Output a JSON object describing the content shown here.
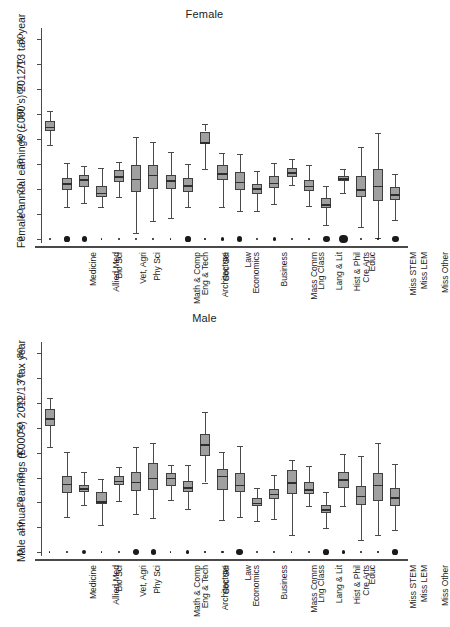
{
  "figure": {
    "panels": [
      {
        "key": "female",
        "title": "Female",
        "ylabel": "Female annual earnings (£000's) 2012/13 tax year"
      },
      {
        "key": "male",
        "title": "Male",
        "ylabel": "Male annual earnings (£000's) 2012/13 tax year"
      }
    ]
  },
  "chart_data": [
    {
      "type": "box",
      "title": "Female",
      "xlabel": "",
      "ylabel": "Female annual earnings (£000's) 2012/13 tax year",
      "ylim": [
        0,
        83
      ],
      "yticks": [
        0,
        10,
        20,
        30,
        40,
        50,
        60,
        70,
        80
      ],
      "grid": false,
      "legend": "none",
      "categories": [
        "Medicine",
        "Allied Med",
        "Bio Sci",
        "Vet, Agri",
        "Phy Sci",
        "Math & Comp",
        "Eng & Tech",
        "Architecture",
        "Soc Sci",
        "Economics",
        "Law",
        "Business",
        "Mass Comm",
        "Lng Class",
        "Lang & Lit",
        "Hist & Phil",
        "Cre Arts",
        "Educ",
        "Miss STEM",
        "Miss LEM",
        "Miss Other"
      ],
      "boxes": [
        {
          "category": "Medicine",
          "whisker_low": 37.5,
          "q1": 43.3,
          "median": 45.0,
          "q3": 47.3,
          "whisker_high": 51.5,
          "n_size": 0.35
        },
        {
          "category": "Allied Med",
          "whisker_low": 13.0,
          "q1": 19.6,
          "median": 22.3,
          "q3": 24.3,
          "whisker_high": 30.5,
          "n_size": 1.0
        },
        {
          "category": "Bio Sci",
          "whisker_low": 14.6,
          "q1": 20.7,
          "median": 24.0,
          "q3": 25.5,
          "whisker_high": 29.3,
          "n_size": 1.0
        },
        {
          "category": "Vet, Agri",
          "whisker_low": 13.0,
          "q1": 16.8,
          "median": 18.6,
          "q3": 21.3,
          "whisker_high": 28.3,
          "n_size": 0.3
        },
        {
          "category": "Phy Sci",
          "whisker_low": 16.8,
          "q1": 22.8,
          "median": 25.1,
          "q3": 27.8,
          "whisker_high": 30.8,
          "n_size": 0.48
        },
        {
          "category": "Math & Comp",
          "whisker_low": 2.3,
          "q1": 18.9,
          "median": 24.2,
          "q3": 29.5,
          "whisker_high": 41.0,
          "n_size": 0.48
        },
        {
          "category": "Eng & Tech",
          "whisker_low": 7.3,
          "q1": 20.2,
          "median": 25.8,
          "q3": 29.5,
          "whisker_high": 38.8,
          "n_size": 0.35
        },
        {
          "category": "Architecture",
          "whisker_low": 8.3,
          "q1": 20.0,
          "median": 23.5,
          "q3": 25.8,
          "whisker_high": 35.0,
          "n_size": 0.28
        },
        {
          "category": "Soc Sci",
          "whisker_low": 12.7,
          "q1": 18.8,
          "median": 21.6,
          "q3": 24.6,
          "whisker_high": 30.1,
          "n_size": 1.0
        },
        {
          "category": "Economics",
          "whisker_low": 28.0,
          "q1": 37.9,
          "median": 38.8,
          "q3": 43.1,
          "whisker_high": 46.3,
          "n_size": 0.3
        },
        {
          "category": "Law",
          "whisker_low": 12.9,
          "q1": 23.7,
          "median": 26.4,
          "q3": 29.6,
          "whisker_high": 34.5,
          "n_size": 0.6
        },
        {
          "category": "Business",
          "whisker_low": 11.2,
          "q1": 19.8,
          "median": 22.9,
          "q3": 27.0,
          "whisker_high": 34.1,
          "n_size": 1.0
        },
        {
          "category": "Mass Comm",
          "whisker_low": 11.4,
          "q1": 18.2,
          "median": 20.3,
          "q3": 22.2,
          "whisker_high": 27.2,
          "n_size": 0.48
        },
        {
          "category": "Lng Class",
          "whisker_low": 14.0,
          "q1": 20.4,
          "median": 22.6,
          "q3": 25.2,
          "whisker_high": 30.5,
          "n_size": 0.6
        },
        {
          "category": "Lang & Lit",
          "whisker_low": 21.5,
          "q1": 24.8,
          "median": 26.8,
          "q3": 28.6,
          "whisker_high": 32.0,
          "n_size": 0.38
        },
        {
          "category": "Hist & Phil",
          "whisker_low": 13.2,
          "q1": 19.3,
          "median": 21.3,
          "q3": 23.6,
          "whisker_high": 29.7,
          "n_size": 0.35
        },
        {
          "category": "Cre Arts",
          "whisker_low": 5.8,
          "q1": 12.4,
          "median": 14.0,
          "q3": 16.4,
          "whisker_high": 21.4,
          "n_size": 1.3
        },
        {
          "category": "Educ",
          "whisker_low": 18.5,
          "q1": 23.4,
          "median": 24.4,
          "q3": 25.3,
          "whisker_high": 28.0,
          "n_size": 1.6
        },
        {
          "category": "Miss STEM",
          "whisker_low": 4.9,
          "q1": 16.8,
          "median": 20.0,
          "q3": 25.3,
          "whisker_high": 36.8,
          "n_size": 0.35
        },
        {
          "category": "Miss LEM",
          "whisker_low": 0.5,
          "q1": 15.2,
          "median": 21.3,
          "q3": 27.9,
          "whisker_high": 42.4,
          "n_size": 0.28
        },
        {
          "category": "Miss Other",
          "whisker_low": 7.5,
          "q1": 15.6,
          "median": 18.0,
          "q3": 20.9,
          "whisker_high": 26.0,
          "n_size": 1.3
        }
      ]
    },
    {
      "type": "box",
      "title": "Male",
      "xlabel": "",
      "ylabel": "Male annual earnings (£000's) 2012/13 tax year",
      "ylim": [
        0,
        83
      ],
      "yticks": [
        0,
        10,
        20,
        30,
        40,
        50,
        60,
        70,
        80
      ],
      "grid": false,
      "legend": "none",
      "categories": [
        "Medicine",
        "Allied Med",
        "Bio Sci",
        "Vet, Agri",
        "Phy Sci",
        "Math & Comp",
        "Eng & Tech",
        "Architecture",
        "Soc Sci",
        "Economics",
        "Law",
        "Business",
        "Mass Comm",
        "Lng Class",
        "Lang & Lit",
        "Hist & Phil",
        "Cre Arts",
        "Educ",
        "Miss STEM",
        "Miss LEM",
        "Miss Other"
      ],
      "boxes": [
        {
          "category": "Medicine",
          "whisker_low": 42.3,
          "q1": 50.6,
          "median": 53.8,
          "q3": 57.5,
          "whisker_high": 62.0,
          "n_size": 0.3
        },
        {
          "category": "Allied Med",
          "whisker_low": 14.2,
          "q1": 23.6,
          "median": 27.4,
          "q3": 30.6,
          "whisker_high": 40.2,
          "n_size": 0.35
        },
        {
          "category": "Bio Sci",
          "whisker_low": 18.9,
          "q1": 24.1,
          "median": 25.6,
          "q3": 26.9,
          "whisker_high": 32.4,
          "n_size": 0.8
        },
        {
          "category": "Vet, Agri",
          "whisker_low": 10.9,
          "q1": 19.4,
          "median": 20.4,
          "q3": 24.1,
          "whisker_high": 29.3,
          "n_size": 0.25
        },
        {
          "category": "Phy Sci",
          "whisker_low": 20.6,
          "q1": 27.1,
          "median": 28.8,
          "q3": 30.5,
          "whisker_high": 34.3,
          "n_size": 0.48
        },
        {
          "category": "Math & Comp",
          "whisker_low": 15.3,
          "q1": 24.5,
          "median": 28.3,
          "q3": 32.1,
          "whisker_high": 42.5,
          "n_size": 1.25
        },
        {
          "category": "Eng & Tech",
          "whisker_low": 13.7,
          "q1": 25.1,
          "median": 30.0,
          "q3": 36.0,
          "whisker_high": 44.0,
          "n_size": 1.0
        },
        {
          "category": "Architecture",
          "whisker_low": 21.1,
          "q1": 26.5,
          "median": 30.0,
          "q3": 31.7,
          "whisker_high": 35.0,
          "n_size": 0.3
        },
        {
          "category": "Soc Sci",
          "whisker_low": 17.2,
          "q1": 24.1,
          "median": 26.0,
          "q3": 28.7,
          "whisker_high": 35.2,
          "n_size": 0.6
        },
        {
          "category": "Economics",
          "whisker_low": 28.0,
          "q1": 38.5,
          "median": 43.5,
          "q3": 47.4,
          "whisker_high": 56.5,
          "n_size": 0.3
        },
        {
          "category": "Law",
          "whisker_low": 12.7,
          "q1": 24.8,
          "median": 30.8,
          "q3": 33.5,
          "whisker_high": 40.3,
          "n_size": 0.48
        },
        {
          "category": "Business",
          "whisker_low": 14.0,
          "q1": 24.0,
          "median": 27.0,
          "q3": 31.9,
          "whisker_high": 42.8,
          "n_size": 1.3
        },
        {
          "category": "Mass Comm",
          "whisker_low": 12.3,
          "q1": 18.5,
          "median": 19.8,
          "q3": 21.8,
          "whisker_high": 25.9,
          "n_size": 0.48
        },
        {
          "category": "Lng Class",
          "whisker_low": 13.4,
          "q1": 21.3,
          "median": 23.4,
          "q3": 25.3,
          "whisker_high": 31.1,
          "n_size": 0.38
        },
        {
          "category": "Lang & Lit",
          "whisker_low": 7.0,
          "q1": 23.2,
          "median": 28.2,
          "q3": 33.1,
          "whisker_high": 37.1,
          "n_size": 0.28
        },
        {
          "category": "Hist & Phil",
          "whisker_low": 18.7,
          "q1": 23.3,
          "median": 25.3,
          "q3": 28.1,
          "whisker_high": 34.6,
          "n_size": 0.48
        },
        {
          "category": "Cre Arts",
          "whisker_low": 9.7,
          "q1": 15.6,
          "median": 17.2,
          "q3": 19.0,
          "whisker_high": 24.0,
          "n_size": 1.1
        },
        {
          "category": "Educ",
          "whisker_low": 18.7,
          "q1": 25.7,
          "median": 29.3,
          "q3": 32.4,
          "whisker_high": 39.6,
          "n_size": 0.7
        },
        {
          "category": "Miss STEM",
          "whisker_low": 5.0,
          "q1": 18.9,
          "median": 22.6,
          "q3": 26.6,
          "whisker_high": 38.5,
          "n_size": 0.35
        },
        {
          "category": "Miss LEM",
          "whisker_low": 6.7,
          "q1": 20.7,
          "median": 27.1,
          "q3": 32.0,
          "whisker_high": 43.9,
          "n_size": 0.28
        },
        {
          "category": "Miss Other",
          "whisker_low": 8.9,
          "q1": 18.6,
          "median": 22.0,
          "q3": 25.8,
          "whisker_high": 35.6,
          "n_size": 1.1
        }
      ]
    }
  ]
}
